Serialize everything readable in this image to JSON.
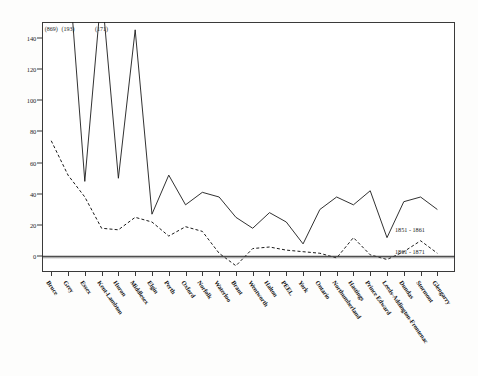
{
  "chart_data": {
    "type": "line",
    "title": "",
    "subtitle": "",
    "xlabel": "",
    "ylabel": "",
    "ylim": [
      -10,
      150
    ],
    "yticks": [
      0,
      20,
      40,
      60,
      80,
      100,
      120,
      140
    ],
    "ytick_labels": [
      "0",
      "20",
      "40",
      "60",
      "80",
      "100",
      "120",
      "140"
    ],
    "grid": false,
    "legend_position": "in-plot-right",
    "zero_line": true,
    "categories": [
      "Bruce",
      "Grey",
      "Essex",
      "Kent-Lambton",
      "Huron",
      "Middlesex",
      "Elgin",
      "Perth",
      "Oxford",
      "Norfolk",
      "Waterloo",
      "Brant",
      "Wentworth",
      "Halton",
      "PEEL",
      "York",
      "Ontario",
      "Northumberland",
      "Hastings",
      "Prince Edward",
      "Leeds-Addington-Frontenac",
      "Dundas",
      "Stormont",
      "Glengarry"
    ],
    "series": [
      {
        "name": "1851 - 1861",
        "style": "solid",
        "color": "#1a1a1a",
        "values": [
          869,
          193,
          48,
          171,
          50,
          145,
          27,
          52,
          33,
          41,
          38,
          25,
          18,
          28,
          22,
          8,
          30,
          38,
          33,
          42,
          12,
          35,
          38,
          30
        ],
        "offscale_indices": [
          0,
          1,
          3,
          5
        ],
        "offscale_labels": [
          "(869)",
          "(193)",
          "(171)",
          "(145)"
        ]
      },
      {
        "name": "1861 - 1871",
        "style": "dashed",
        "color": "#1a1a1a",
        "values": [
          74,
          52,
          38,
          18,
          17,
          25,
          22,
          13,
          19,
          16,
          2,
          -6,
          5,
          6,
          4,
          3,
          2,
          -1,
          12,
          1,
          -2,
          3,
          10,
          2
        ]
      }
    ],
    "peak_annotations": [
      {
        "label": "(869)",
        "category": "Bruce"
      },
      {
        "label": "(193)",
        "category": "Grey"
      },
      {
        "label": "(171)",
        "category": "Kent-Lambton"
      }
    ]
  }
}
